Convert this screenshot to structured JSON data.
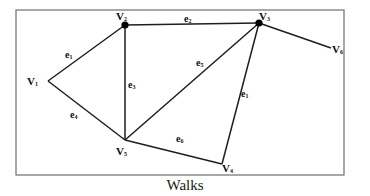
{
  "figure": {
    "caption": "Walks",
    "frame": {
      "x": 16,
      "y": 10,
      "width": 328,
      "height": 165,
      "stroke": "#6f6f6f"
    },
    "edge_color": "#1e1e1e"
  },
  "vertices": [
    {
      "id": "V1",
      "base": "V",
      "sub": "1",
      "x": 48,
      "y": 81,
      "dot": false,
      "lx": 27,
      "ly": 85
    },
    {
      "id": "V2",
      "base": "V",
      "sub": "2",
      "x": 125,
      "y": 25,
      "dot": true,
      "lx": 116,
      "ly": 20
    },
    {
      "id": "V3",
      "base": "V",
      "sub": "3",
      "x": 259,
      "y": 23,
      "dot": true,
      "lx": 259,
      "ly": 20
    },
    {
      "id": "V4",
      "base": "V",
      "sub": "4",
      "x": 222,
      "y": 164,
      "dot": false,
      "lx": 222,
      "ly": 172
    },
    {
      "id": "V5",
      "base": "V",
      "sub": "5",
      "x": 125,
      "y": 140,
      "dot": false,
      "lx": 116,
      "ly": 155
    },
    {
      "id": "V6",
      "base": "V",
      "sub": "6",
      "x": 331,
      "y": 48,
      "dot": false,
      "lx": 332,
      "ly": 53
    }
  ],
  "edges": [
    {
      "id": "e1a",
      "from": "V1",
      "to": "V2",
      "base": "e",
      "sub": "1",
      "lx": 65,
      "ly": 58
    },
    {
      "id": "e2",
      "from": "V2",
      "to": "V3",
      "base": "e",
      "sub": "2",
      "lx": 184,
      "ly": 22
    },
    {
      "id": "e3",
      "from": "V2",
      "to": "V5",
      "base": "e",
      "sub": "3",
      "lx": 128,
      "ly": 88
    },
    {
      "id": "e4",
      "from": "V1",
      "to": "V5",
      "base": "e",
      "sub": "4",
      "lx": 70,
      "ly": 118
    },
    {
      "id": "e5",
      "from": "V5",
      "to": "V3",
      "base": "e",
      "sub": "5",
      "lx": 196,
      "ly": 66
    },
    {
      "id": "e6",
      "from": "V5",
      "to": "V4",
      "base": "e",
      "sub": "6",
      "lx": 176,
      "ly": 142
    },
    {
      "id": "e1b",
      "from": "V3",
      "to": "V4",
      "base": "e",
      "sub": "1",
      "lx": 241,
      "ly": 97
    },
    {
      "id": "e36",
      "from": "V3",
      "to": "V6",
      "base": "",
      "sub": "",
      "lx": null,
      "ly": null
    }
  ]
}
